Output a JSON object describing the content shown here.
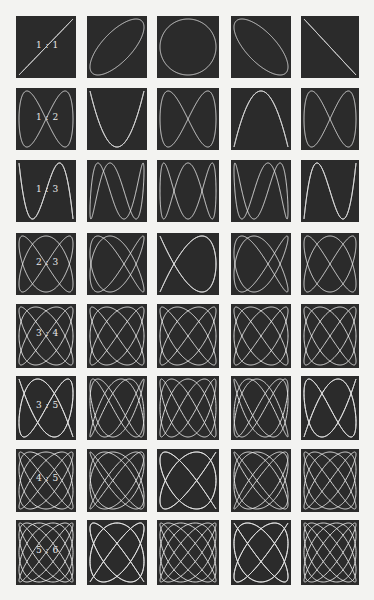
{
  "figure": {
    "background": "#f3f3f1",
    "panel_color": "#2b2b2b",
    "curve_color": "#e6e6e6",
    "phases": [
      "0",
      "π/4",
      "π/2",
      "3π/4",
      "π"
    ],
    "columns_x": [
      [
        16,
        76
      ],
      [
        87,
        147
      ],
      [
        157,
        219
      ],
      [
        231,
        291
      ],
      [
        301,
        359
      ]
    ],
    "rows": [
      {
        "ratio": "1 : 1",
        "a": 1,
        "b": 1,
        "y": [
          16,
          78
        ]
      },
      {
        "ratio": "1 : 2",
        "a": 1,
        "b": 2,
        "y": [
          88,
          150
        ]
      },
      {
        "ratio": "1 : 3",
        "a": 1,
        "b": 3,
        "y": [
          160,
          222
        ]
      },
      {
        "ratio": "2 : 3",
        "a": 2,
        "b": 3,
        "y": [
          233,
          295
        ]
      },
      {
        "ratio": "3 : 4",
        "a": 3,
        "b": 4,
        "y": [
          304,
          368
        ]
      },
      {
        "ratio": "3 : 5",
        "a": 3,
        "b": 5,
        "y": [
          376,
          440
        ]
      },
      {
        "ratio": "4 : 5",
        "a": 4,
        "b": 5,
        "y": [
          449,
          512
        ]
      },
      {
        "ratio": "5 : 6",
        "a": 5,
        "b": 6,
        "y": [
          520,
          585
        ]
      }
    ]
  }
}
